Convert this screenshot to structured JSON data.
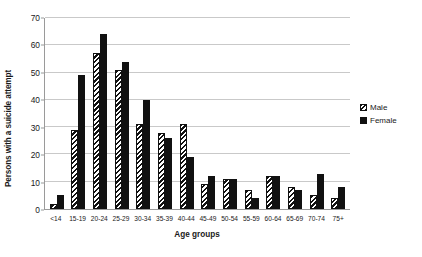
{
  "chart_data": {
    "type": "bar",
    "title": "",
    "xlabel": "Age groups",
    "ylabel": "Persons with a suicide attempt",
    "ylim": [
      0,
      70
    ],
    "ytick_step": 10,
    "yticks": [
      0,
      10,
      20,
      30,
      40,
      50,
      60,
      70
    ],
    "grid": true,
    "legend_position": "right",
    "categories": [
      "<14",
      "15-19",
      "20-24",
      "25-29",
      "30-34",
      "35-39",
      "40-44",
      "45-49",
      "50-54",
      "55-59",
      "60-64",
      "65-69",
      "70-74",
      "75+"
    ],
    "series": [
      {
        "name": "Male",
        "pattern": "diagonal-hatch",
        "color": "#111111",
        "values": [
          2,
          29,
          57,
          51,
          31,
          28,
          31,
          9,
          11,
          7,
          12,
          8,
          5,
          4
        ]
      },
      {
        "name": "Female",
        "pattern": "solid",
        "color": "#111111",
        "values": [
          5,
          49,
          64,
          54,
          40,
          26,
          19,
          12,
          11,
          4,
          12,
          7,
          13,
          8
        ]
      }
    ]
  },
  "legend": {
    "entries": [
      {
        "label": "Male",
        "swatch": "male"
      },
      {
        "label": "Female",
        "swatch": "female"
      }
    ]
  }
}
